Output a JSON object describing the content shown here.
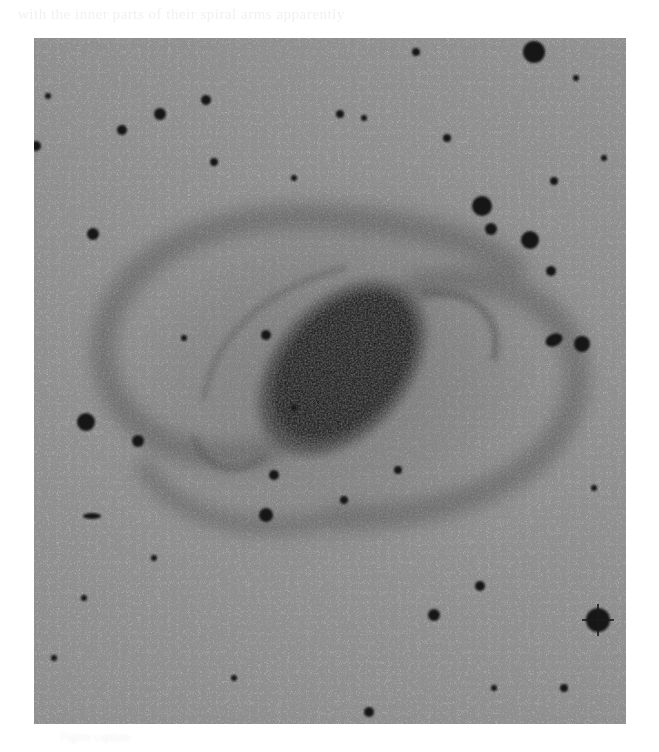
{
  "header": {
    "text": "with the inner parts of their spiral arms apparently"
  },
  "photo": {
    "subject": "barred spiral galaxy photographic plate",
    "description": "Negative photographic plate: dark elongated galactic core with faint spiral arms and field stars on grainy grey background",
    "colors": {
      "background": "#a9a9a9",
      "grain_light": "#c4c4c4",
      "grain_dark": "#8a8a8a",
      "core": "#151515",
      "arms": "#7e7e7e",
      "stars": "#1a1a1a"
    }
  },
  "footer": {
    "text": "Figure caption"
  }
}
